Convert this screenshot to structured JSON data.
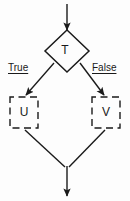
{
  "diagram": {
    "background_color": "#fdfdfd",
    "line_color": "#1a1a1a",
    "nodes": {
      "decision": {
        "label": "T",
        "shape": "diamond",
        "border_style": "solid"
      },
      "true_branch": {
        "label": "U",
        "shape": "rectangle",
        "border_style": "dashed"
      },
      "false_branch": {
        "label": "V",
        "shape": "rectangle",
        "border_style": "dashed"
      }
    },
    "edges": {
      "true_label": "True",
      "false_label": "False"
    },
    "arrows": {
      "entry": "arrow-down-into-decision",
      "exit": "arrow-down-from-merge",
      "left_branch": "arrow-down-left-into-u",
      "right_branch": "arrow-down-right-into-v",
      "u_to_merge": "line-down-right",
      "v_to_merge": "line-down-left"
    }
  }
}
